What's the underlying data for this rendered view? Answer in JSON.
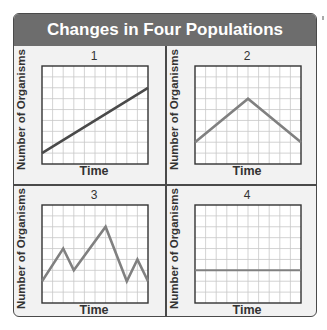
{
  "title": "Changes in Four Populations",
  "colors": {
    "header_bg": "#6d6d6d",
    "header_text": "#ffffff",
    "frame": "#4a4a4a",
    "panel_bg": "#f2f2f2",
    "grid": "#c8c8c8",
    "line_dark": "#4a4a4a",
    "line_gray": "#808080"
  },
  "panels": [
    {
      "number": "1",
      "ylabel": "Number of Organisms",
      "xlabel": "Time"
    },
    {
      "number": "2",
      "ylabel": "Number of Organisms",
      "xlabel": "Time"
    },
    {
      "number": "3",
      "ylabel": "Number of Organisms",
      "xlabel": "Time"
    },
    {
      "number": "4",
      "ylabel": "Number of Organisms",
      "xlabel": "Time"
    }
  ],
  "chart_data": [
    {
      "type": "line",
      "title": "1",
      "xlabel": "Time",
      "ylabel": "Number of Organisms",
      "grid": true,
      "x": [
        0,
        10
      ],
      "y": [
        1,
        7
      ],
      "description": "steady increase"
    },
    {
      "type": "line",
      "title": "2",
      "xlabel": "Time",
      "ylabel": "Number of Organisms",
      "grid": true,
      "x": [
        0,
        5,
        10
      ],
      "y": [
        2,
        6,
        2
      ],
      "description": "increase then decrease"
    },
    {
      "type": "line",
      "title": "3",
      "xlabel": "Time",
      "ylabel": "Number of Organisms",
      "grid": true,
      "x": [
        0,
        2,
        3,
        6,
        8,
        9,
        10
      ],
      "y": [
        2,
        5,
        3,
        7,
        2,
        4,
        2
      ],
      "description": "fluctuating"
    },
    {
      "type": "line",
      "title": "4",
      "xlabel": "Time",
      "ylabel": "Number of Organisms",
      "grid": true,
      "x": [
        0,
        10
      ],
      "y": [
        3,
        3
      ],
      "description": "constant"
    }
  ]
}
